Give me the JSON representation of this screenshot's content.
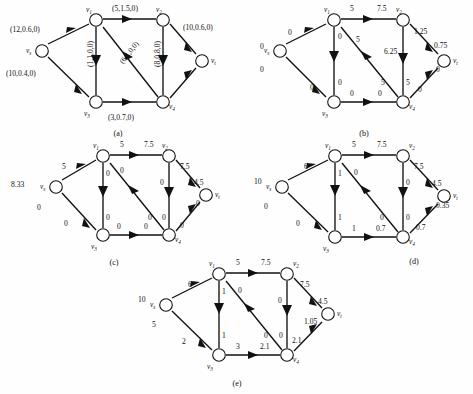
{
  "figure": {
    "type": "network-flow-diagram-set",
    "panel_count": 5,
    "node_names": {
      "s": "v",
      "s_sub": "s",
      "v1": "v",
      "v1_sub": "1",
      "v2": "v",
      "v2_sub": "2",
      "v3": "v",
      "v3_sub": "3",
      "v4": "v",
      "v4_sub": "4",
      "t": "v",
      "t_sub": "t"
    }
  },
  "panels": [
    {
      "id": "a",
      "caption": "(a)",
      "label_format": "(capacity,cost,flow,?)",
      "nodes": [
        {
          "key": "s",
          "name": "v",
          "sub": "s",
          "label_pos": "left"
        },
        {
          "key": "v1",
          "name": "v",
          "sub": "1",
          "label_pos": "above-left"
        },
        {
          "key": "v2",
          "name": "v",
          "sub": "2",
          "label_pos": "above-right"
        },
        {
          "key": "v3",
          "name": "v",
          "sub": "3",
          "label_pos": "below-left"
        },
        {
          "key": "v4",
          "name": "v",
          "sub": "4",
          "label_pos": "below-right"
        },
        {
          "key": "t",
          "name": "v",
          "sub": "t",
          "label_pos": "right"
        }
      ],
      "edges": [
        {
          "from": "s",
          "to": "v1",
          "label": "(12,0.6,0)",
          "pos": "above-left"
        },
        {
          "from": "s",
          "to": "v3",
          "label": "(10,0.4,0)",
          "pos": "below-left"
        },
        {
          "from": "v1",
          "to": "v2",
          "label": "(5,1.5,0)",
          "pos": "above"
        },
        {
          "from": "v1",
          "to": "v3",
          "label": "(1,1,0,0)",
          "pos": "vertical-left"
        },
        {
          "from": "v4",
          "to": "v1",
          "label": "(6,1,0,0)",
          "pos": "diagonal"
        },
        {
          "from": "v2",
          "to": "v4",
          "label": "(8,0.8,0)",
          "pos": "vertical-right"
        },
        {
          "from": "v2",
          "to": "t",
          "label": "(10,0.6,0)",
          "pos": "above-right"
        },
        {
          "from": "v3",
          "to": "v4",
          "label": "(3,0.7,0)",
          "pos": "below"
        },
        {
          "from": "v4",
          "to": "t",
          "label": "",
          "pos": "below-right"
        }
      ]
    },
    {
      "id": "b",
      "caption": "(b)",
      "label_format": "flow",
      "nodes": [
        {
          "key": "s",
          "name": "v",
          "sub": "s",
          "label_pos": "left"
        },
        {
          "key": "v1",
          "name": "v",
          "sub": "1",
          "label_pos": "above-left"
        },
        {
          "key": "v2",
          "name": "v",
          "sub": "2",
          "label_pos": "above-right"
        },
        {
          "key": "v3",
          "name": "v",
          "sub": "3",
          "label_pos": "below-left"
        },
        {
          "key": "v4",
          "name": "v",
          "sub": "4",
          "label_pos": "below-right"
        },
        {
          "key": "t",
          "name": "v",
          "sub": "t",
          "label_pos": "right"
        }
      ],
      "edges": [
        {
          "from": "s",
          "to": "v1",
          "label": "0",
          "label2": "0",
          "pos": "above-left"
        },
        {
          "from": "s",
          "to": "v3",
          "label": "0",
          "label2": "0",
          "pos": "below-left"
        },
        {
          "from": "v1",
          "to": "v2",
          "label": "5",
          "label2": "7.5",
          "pos": "above"
        },
        {
          "from": "v1",
          "to": "v3",
          "label": "0",
          "label2": "0",
          "pos": "vertical-left"
        },
        {
          "from": "v4",
          "to": "v1",
          "label": "5",
          "label2": "5",
          "pos": "diagonal"
        },
        {
          "from": "v2",
          "to": "v4",
          "label": "6.25",
          "label2": "5",
          "pos": "vertical-right"
        },
        {
          "from": "v2",
          "to": "t",
          "label": "1.25",
          "label2": "0.75",
          "pos": "above-right"
        },
        {
          "from": "v3",
          "to": "v4",
          "label": "0",
          "label2": "0",
          "pos": "below"
        },
        {
          "from": "v4",
          "to": "t",
          "label": "0",
          "label2": "0",
          "pos": "below-right"
        }
      ]
    },
    {
      "id": "c",
      "caption": "(c)",
      "label_format": "flow",
      "nodes": [
        {
          "key": "s",
          "name": "v",
          "sub": "s",
          "label_pos": "left"
        },
        {
          "key": "v1",
          "name": "v",
          "sub": "1",
          "label_pos": "above-left"
        },
        {
          "key": "v2",
          "name": "v",
          "sub": "2",
          "label_pos": "above-right"
        },
        {
          "key": "v3",
          "name": "v",
          "sub": "3",
          "label_pos": "below-left"
        },
        {
          "key": "v4",
          "name": "v",
          "sub": "4",
          "label_pos": "below-right"
        },
        {
          "key": "t",
          "name": "v",
          "sub": "t",
          "label_pos": "right"
        }
      ],
      "edges": [
        {
          "from": "s",
          "to": "v1",
          "label": "8.33",
          "label2": "5",
          "pos": "above-left"
        },
        {
          "from": "s",
          "to": "v3",
          "label": "0",
          "label2": "0",
          "pos": "below-left"
        },
        {
          "from": "v1",
          "to": "v2",
          "label": "5",
          "label2": "7.5",
          "pos": "above"
        },
        {
          "from": "v1",
          "to": "v3",
          "label": "0",
          "label2": "0",
          "pos": "vertical-left"
        },
        {
          "from": "v4",
          "to": "v1",
          "label": "0",
          "label2": "0",
          "pos": "diagonal"
        },
        {
          "from": "v2",
          "to": "v4",
          "label": "0",
          "label2": "0",
          "pos": "vertical-right"
        },
        {
          "from": "v2",
          "to": "t",
          "label": "7.5",
          "label2": "4.5",
          "pos": "above-right"
        },
        {
          "from": "v3",
          "to": "v4",
          "label": "0",
          "label2": "0",
          "pos": "below"
        },
        {
          "from": "v4",
          "to": "t",
          "label": "0",
          "label2": "0",
          "pos": "below-right"
        }
      ]
    },
    {
      "id": "d",
      "caption": "(d)",
      "label_format": "flow",
      "nodes": [
        {
          "key": "s",
          "name": "v",
          "sub": "s",
          "label_pos": "left"
        },
        {
          "key": "v1",
          "name": "v",
          "sub": "1",
          "label_pos": "above-left"
        },
        {
          "key": "v2",
          "name": "v",
          "sub": "2",
          "label_pos": "above-right"
        },
        {
          "key": "v3",
          "name": "v",
          "sub": "3",
          "label_pos": "below-left"
        },
        {
          "key": "v4",
          "name": "v",
          "sub": "4",
          "label_pos": "below-right"
        },
        {
          "key": "t",
          "name": "v",
          "sub": "t",
          "label_pos": "right"
        }
      ],
      "edges": [
        {
          "from": "s",
          "to": "v1",
          "label": "10",
          "label2": "6",
          "pos": "above-left"
        },
        {
          "from": "s",
          "to": "v3",
          "label": "0",
          "label2": "0",
          "pos": "below-left"
        },
        {
          "from": "v1",
          "to": "v2",
          "label": "5",
          "label2": "7.5",
          "pos": "above"
        },
        {
          "from": "v1",
          "to": "v3",
          "label": "1",
          "label2": "1",
          "pos": "vertical-left"
        },
        {
          "from": "v4",
          "to": "v1",
          "label": "0",
          "label2": "0",
          "pos": "diagonal"
        },
        {
          "from": "v2",
          "to": "v4",
          "label": "0",
          "label2": "0",
          "pos": "vertical-right"
        },
        {
          "from": "v2",
          "to": "t",
          "label": "7.5",
          "label2": "4.5",
          "pos": "above-right"
        },
        {
          "from": "v3",
          "to": "v4",
          "label": "1",
          "label2": "0.7",
          "pos": "below"
        },
        {
          "from": "v4",
          "to": "t",
          "label": "0.7",
          "label2": "0.35",
          "pos": "below-right"
        }
      ]
    },
    {
      "id": "e",
      "caption": "(e)",
      "label_format": "flow",
      "nodes": [
        {
          "key": "s",
          "name": "v",
          "sub": "s",
          "label_pos": "left"
        },
        {
          "key": "v1",
          "name": "v",
          "sub": "1",
          "label_pos": "above-left"
        },
        {
          "key": "v2",
          "name": "v",
          "sub": "2",
          "label_pos": "above-right"
        },
        {
          "key": "v3",
          "name": "v",
          "sub": "3",
          "label_pos": "below-left"
        },
        {
          "key": "v4",
          "name": "v",
          "sub": "4",
          "label_pos": "below-right"
        },
        {
          "key": "t",
          "name": "v",
          "sub": "t",
          "label_pos": "right"
        }
      ],
      "edges": [
        {
          "from": "s",
          "to": "v1",
          "label": "10",
          "label2": "6",
          "pos": "above-left"
        },
        {
          "from": "s",
          "to": "v3",
          "label": "5",
          "label2": "2",
          "pos": "below-left"
        },
        {
          "from": "v1",
          "to": "v2",
          "label": "5",
          "label2": "7.5",
          "pos": "above"
        },
        {
          "from": "v1",
          "to": "v3",
          "label": "1",
          "label2": "1",
          "pos": "vertical-left"
        },
        {
          "from": "v4",
          "to": "v1",
          "label": "0",
          "label2": "0",
          "pos": "diagonal"
        },
        {
          "from": "v2",
          "to": "v4",
          "label": "0",
          "label2": "0",
          "pos": "vertical-right"
        },
        {
          "from": "v2",
          "to": "t",
          "label": "7.5",
          "label2": "4.5",
          "pos": "above-right"
        },
        {
          "from": "v3",
          "to": "v4",
          "label": "3",
          "label2": "2.1",
          "pos": "below"
        },
        {
          "from": "v4",
          "to": "t",
          "label": "2.1",
          "label2": "1.05",
          "pos": "below-right"
        }
      ]
    }
  ]
}
